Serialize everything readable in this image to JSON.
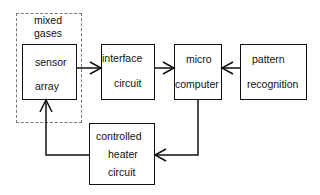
{
  "diagram": {
    "region": {
      "label_line1": "mixed",
      "label_line2": "gases"
    },
    "blocks": {
      "sensor": {
        "line1": "sensor",
        "line2": "array"
      },
      "interface": {
        "line1": "interface",
        "line2": "circuit"
      },
      "micro": {
        "line1": "micro",
        "line2": "computer"
      },
      "pattern": {
        "line1": "pattern",
        "line2": "recognition"
      },
      "heater": {
        "line1": "controlled",
        "line2": "heater",
        "line3": "circuit"
      }
    },
    "connections": [
      {
        "from": "sensor array",
        "to": "interface circuit"
      },
      {
        "from": "interface circuit",
        "to": "micro computer"
      },
      {
        "from": "pattern recognition",
        "to": "micro computer"
      },
      {
        "from": "micro computer",
        "to": "controlled heater circuit"
      },
      {
        "from": "controlled heater circuit",
        "to": "sensor array"
      }
    ]
  }
}
